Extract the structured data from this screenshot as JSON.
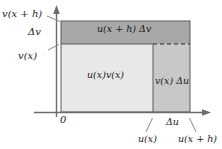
{
  "figure": {
    "colors": {
      "background": "#ffffff",
      "axis": "#6b6b6b",
      "outline": "#4a4a4a",
      "text": "#1a1a1a",
      "main_fill": "#e8e8e8",
      "top_strip_fill": "#a8a8a8",
      "right_col_fill": "#c8c8c8",
      "leader": "#8a8a8a"
    },
    "axes": {
      "origin_label": "0",
      "y_labels": [
        {
          "name": "v-x-plus-h",
          "text": "v(x + h)"
        },
        {
          "name": "delta-v",
          "text": "Δv"
        },
        {
          "name": "v-x",
          "text": "v(x)"
        }
      ],
      "x_labels": [
        {
          "name": "u-x",
          "text": "u(x)"
        },
        {
          "name": "delta-u",
          "text": "Δu"
        },
        {
          "name": "u-x-plus-h",
          "text": "u(x + h)"
        }
      ]
    },
    "regions": [
      {
        "name": "top-strip",
        "text": "u(x + h) Δv"
      },
      {
        "name": "main-area",
        "text": "u(x)v(x)"
      },
      {
        "name": "right-col",
        "text": "v(x) Δu"
      }
    ]
  }
}
